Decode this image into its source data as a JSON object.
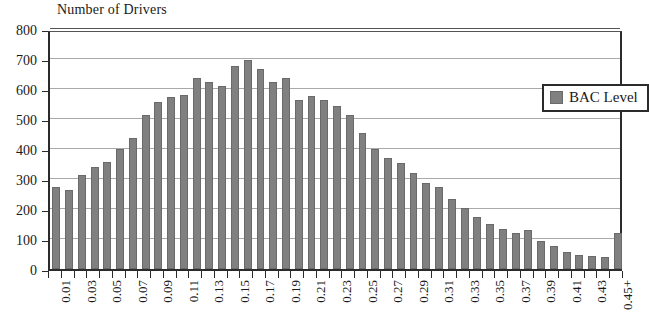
{
  "chart_data": {
    "type": "bar",
    "title": "Number of Drivers",
    "xlabel": "",
    "ylabel": "Number of Drivers",
    "ylim": [
      0,
      800
    ],
    "ytick_step": 100,
    "yticks": [
      0,
      100,
      200,
      300,
      400,
      500,
      600,
      700,
      800
    ],
    "grid": true,
    "legend_position": "upper-right-inside",
    "legend": [
      "BAC Level"
    ],
    "bar_color": "#808080",
    "bar_outline_color": "#6a6a6a",
    "axis_color": "#2b2b2b",
    "gridline_color": "#a9a9a9",
    "x_label_rotation": 90,
    "x_label_interval": 2,
    "categories": [
      "0.01",
      "0.02",
      "0.03",
      "0.04",
      "0.05",
      "0.06",
      "0.07",
      "0.08",
      "0.09",
      "0.10",
      "0.11",
      "0.12",
      "0.13",
      "0.14",
      "0.15",
      "0.16",
      "0.17",
      "0.18",
      "0.19",
      "0.20",
      "0.21",
      "0.22",
      "0.23",
      "0.24",
      "0.25",
      "0.26",
      "0.27",
      "0.28",
      "0.29",
      "0.30",
      "0.31",
      "0.32",
      "0.33",
      "0.34",
      "0.35",
      "0.36",
      "0.37",
      "0.38",
      "0.39",
      "0.40",
      "0.41",
      "0.42",
      "0.43",
      "0.44",
      "0.45+"
    ],
    "visible_xtick_labels": [
      "0.01",
      "0.03",
      "0.05",
      "0.07",
      "0.09",
      "0.11",
      "0.13",
      "0.15",
      "0.17",
      "0.19",
      "0.21",
      "0.23",
      "0.25",
      "0.27",
      "0.29",
      "0.31",
      "0.33",
      "0.35",
      "0.37",
      "0.39",
      "0.41",
      "0.43",
      "0.45+"
    ],
    "series": [
      {
        "name": "BAC Level",
        "values": [
          275,
          262,
          313,
          341,
          356,
          399,
          437,
          513,
          557,
          574,
          580,
          638,
          622,
          610,
          676,
          698,
          666,
          622,
          638,
          562,
          578,
          565,
          545,
          512,
          455,
          400,
          370,
          355,
          320,
          287,
          272,
          235,
          205,
          172,
          150,
          135,
          120,
          130,
          95,
          78,
          58,
          48,
          45,
          40,
          120
        ]
      }
    ],
    "peak": {
      "category": "0.16",
      "value": 698
    }
  },
  "legend_box": {
    "label": "BAC Level",
    "swatch_color": "#808080"
  }
}
